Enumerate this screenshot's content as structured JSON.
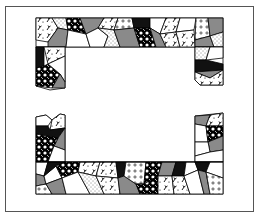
{
  "artwork": {
    "title": "",
    "description": "Crazy-quilt patchwork border frame",
    "colors": {
      "frame_border": "#555555",
      "patch_gray": "#8a8a8a",
      "patch_black": "#111111",
      "patch_white": "#ffffff",
      "outline": "#000000"
    },
    "frame": {
      "x": 5,
      "y": 6,
      "width": 249,
      "height": 206
    },
    "quilt_segments": [
      {
        "name": "top-band",
        "x": 36,
        "y": 18,
        "width": 187,
        "height": 29
      },
      {
        "name": "top-left-leg",
        "x": 36,
        "y": 47,
        "width": 29,
        "height": 41
      },
      {
        "name": "top-right-leg",
        "x": 195,
        "y": 47,
        "width": 28,
        "height": 38
      },
      {
        "name": "bottom-left-leg",
        "x": 36,
        "y": 115,
        "width": 29,
        "height": 47
      },
      {
        "name": "bottom-right-leg",
        "x": 195,
        "y": 115,
        "width": 28,
        "height": 47
      },
      {
        "name": "bottom-band",
        "x": 36,
        "y": 162,
        "width": 187,
        "height": 32
      }
    ]
  }
}
